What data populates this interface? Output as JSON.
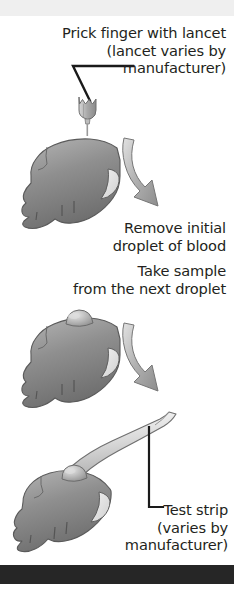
{
  "figure": {
    "name": "blood-glucose-test-steps-diagram",
    "background_color": "#ffffff",
    "top_band_color": "#efefef",
    "bottom_rule_color": "#262626",
    "ink_color": "#231f20",
    "illustration_fill": "#8c8c8c",
    "illustration_light": "#cccccc",
    "illustration_stroke": "#4d4d4d"
  },
  "captions": {
    "lancet": "Prick finger with lancet\n(lancet varies by\nmanufacturer)",
    "remove_droplet": "Remove initial\ndroplet of blood",
    "take_sample": "Take sample\nfrom the next droplet",
    "test_strip": "Test strip\n(varies by\nmanufacturer)"
  },
  "steps": [
    {
      "index": 1,
      "label": "Prick finger with lancet (lancet varies by manufacturer)",
      "illustration": "lancet-above-finger"
    },
    {
      "index": 2,
      "label": "Remove initial droplet of blood",
      "illustration": "finger-no-droplet-with-curved-arrow"
    },
    {
      "index": 3,
      "label": "Take sample from the next droplet",
      "illustration": "finger-with-droplet-and-curved-arrow"
    },
    {
      "index": 4,
      "label": "Test strip (varies by manufacturer)",
      "illustration": "test-strip-touching-droplet-on-finger"
    }
  ],
  "icons": {
    "lancet": "lancet-icon",
    "finger": "finger-icon",
    "blood_droplet": "blood-droplet-icon",
    "curved_arrow": "curved-arrow-icon",
    "test_strip": "test-strip-icon",
    "leader_line": "leader-line-icon"
  }
}
